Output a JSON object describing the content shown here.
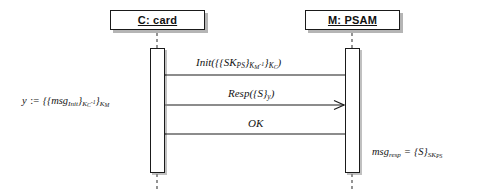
{
  "diagram": {
    "type": "uml-sequence-diagram",
    "background_color": "#ffffff",
    "line_color": "#1a1a1a",
    "lifelines": [
      {
        "id": "card",
        "label": "C: card",
        "center_x": 157,
        "box": {
          "x": 110,
          "y": 10,
          "width": 95,
          "height": 20
        },
        "activation": {
          "x": 150,
          "y": 48,
          "width": 15,
          "height": 125
        }
      },
      {
        "id": "psam",
        "label": "M: PSAM",
        "center_x": 352,
        "box": {
          "x": 305,
          "y": 10,
          "width": 95,
          "height": 20
        },
        "activation": {
          "x": 345,
          "y": 48,
          "width": 15,
          "height": 125
        }
      }
    ],
    "messages": [
      {
        "id": "init",
        "label_plain": "Init({{SK_PS}_{K_M^-1}}_{K_C})",
        "label_html": "Init({{SK<sub>PS</sub>}<sub>K<sub>M</sub><sup>-1</sup></sub>}<sub>K<sub>C</sub></sub>)",
        "from": "psam",
        "to": "card",
        "direction": "right-to-left",
        "y": 75,
        "arrowhead": "open"
      },
      {
        "id": "resp",
        "label_plain": "Resp({S}_y)",
        "label_html": "Resp({S}<sub>y</sub>)",
        "from": "card",
        "to": "psam",
        "direction": "left-to-right",
        "y": 105,
        "arrowhead": "open"
      },
      {
        "id": "ok",
        "label_plain": "OK",
        "label_html": "OK",
        "from": "psam",
        "to": "card",
        "direction": "right-to-left",
        "y": 134,
        "arrowhead": "open"
      }
    ],
    "annotations": [
      {
        "id": "y-definition",
        "label_plain": "y := {{msg_Init}_{K_C^-1}}_{K_M}",
        "label_html": "y <span class=\"assign\">:=</span> {{msg<sub>Init</sub>}<sub>K<sub>C</sub><sup>-1</sup></sub>}<sub>K<sub>M</sub></sub>",
        "x": 22,
        "y": 96,
        "side": "left"
      },
      {
        "id": "msg-resp-definition",
        "label_plain": "msg_resp = {S}_{SK_PS}",
        "label_html": "msg<sub>resp</sub> <span class=\"assign\">=</span> {S}<sub>SK<sub>PS</sub></sub>",
        "x": 372,
        "y": 147,
        "side": "right"
      }
    ]
  }
}
